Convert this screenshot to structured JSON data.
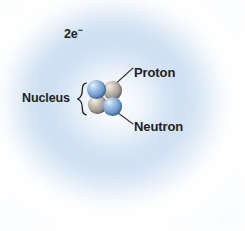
{
  "figure": {
    "background_color": "#ffffff"
  },
  "electron_cloud": {
    "name": "electron-cloud",
    "color": "#cbdef1",
    "description": "diffuse blue spherical electron cloud"
  },
  "labels": {
    "electrons": {
      "text": "2e",
      "superscript": "−"
    },
    "nucleus": "Nucleus",
    "proton": "Proton",
    "neutron": "Neutron",
    "brace": "{"
  },
  "nucleus": {
    "particles": [
      {
        "id": "nucleon-tl",
        "type": "proton",
        "color": "#5e8cc4",
        "position": "top-left"
      },
      {
        "id": "nucleon-tr",
        "type": "neutron",
        "color": "#938c83",
        "position": "top-right"
      },
      {
        "id": "nucleon-bl",
        "type": "neutron",
        "color": "#938c83",
        "position": "bottom-left"
      },
      {
        "id": "nucleon-br",
        "type": "proton",
        "color": "#5e8cc4",
        "position": "bottom-right"
      }
    ],
    "proton_count": 2,
    "neutron_count": 2
  },
  "leader_lines": {
    "proton_line": "from proton label down-left to top-right nucleon",
    "neutron_line": "from bottom-right nucleon down-right to neutron label",
    "color": "#3a3a3a"
  }
}
